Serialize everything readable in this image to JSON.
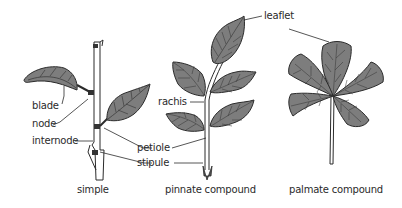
{
  "diagram": {
    "colors": {
      "leaf_fill": "#7d7d7d",
      "outline": "#2b2b2b",
      "vein": "#3a3a3a",
      "stem": "#ffffff",
      "background": "#ffffff"
    },
    "labels": {
      "blade": "blade",
      "node": "node",
      "internode": "internode",
      "petiole": "petiole",
      "stipule": "stipule",
      "rachis": "rachis",
      "leaflet": "leaflet"
    },
    "captions": {
      "simple": "simple",
      "pinnate": "pinnate compound",
      "palmate": "palmate compound"
    }
  }
}
